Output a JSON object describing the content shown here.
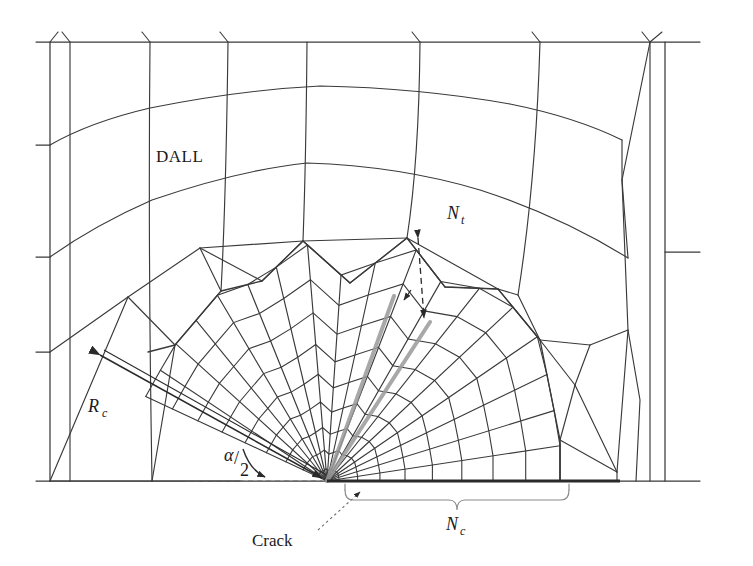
{
  "figure": {
    "background_color": "#ffffff",
    "line_color": "#3a3a3a",
    "highlight_color": "#9a9a9a",
    "text_color": "#1a1a1a"
  },
  "labels": {
    "dall": "DALL",
    "nt_symbol": "N",
    "nt_sub": "t",
    "nc_symbol": "N",
    "nc_sub": "c",
    "rc_symbol": "R",
    "rc_sub": "c",
    "alpha": "α",
    "alpha_denominator": "2",
    "alpha_slash": "/",
    "crack": "Crack"
  },
  "geometry": {
    "crack_tip": {
      "x": 327,
      "y": 481
    },
    "fan_outer_radius": 200,
    "fan_inner_rings": 9,
    "fan_spokes": 19,
    "fan_start_angle_deg": 205,
    "fan_end_angle_deg": 360,
    "outer_boundary": {
      "left_x": 50,
      "right_x": 665,
      "top_y": 42,
      "bottom_y": 481
    },
    "left_stub_ys": [
      42,
      145,
      257,
      352
    ],
    "right_stub_ys": [
      42,
      252,
      481
    ],
    "top_vertical_xs": [
      70,
      150,
      228,
      307,
      420,
      540,
      650
    ],
    "outer_arc_radii": [
      255,
      330,
      420
    ]
  },
  "chart_data": {
    "type": "diagram",
    "annotations": [
      {
        "name": "DALL",
        "role": "region-label"
      },
      {
        "name": "N_t",
        "role": "transition-element-count"
      },
      {
        "name": "N_c",
        "role": "crack-face-element-count"
      },
      {
        "name": "R_c",
        "role": "crack-tip-mesh-radius"
      },
      {
        "name": "alpha/2",
        "role": "half-sweep-angle"
      },
      {
        "name": "Crack",
        "role": "crack-tip-pointer"
      }
    ]
  }
}
